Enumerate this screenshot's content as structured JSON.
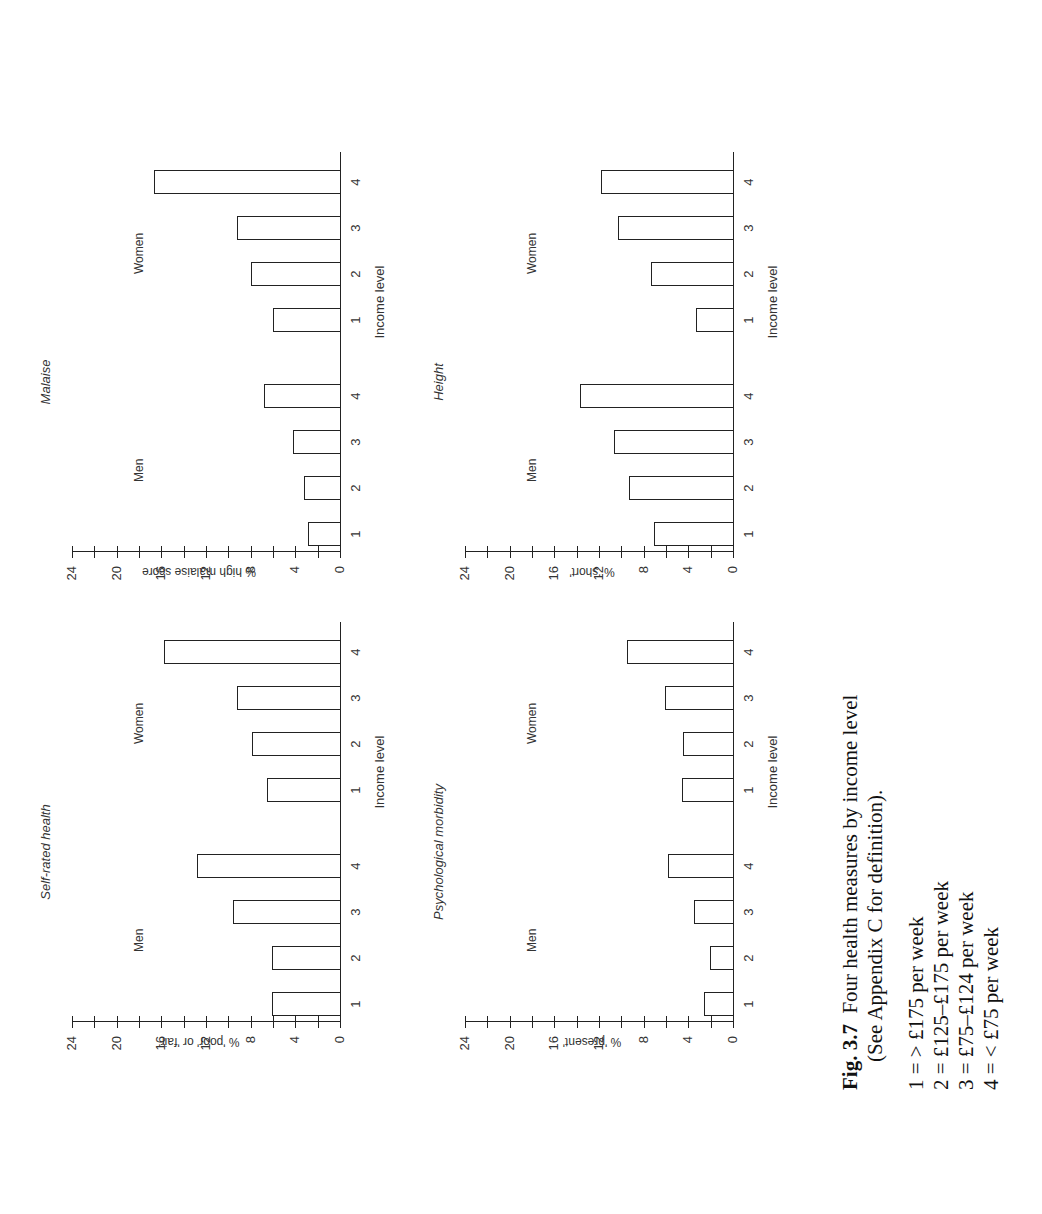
{
  "figure": {
    "label": "Fig. 3.7",
    "title": "Four health measures by income level",
    "subtitle": "(See Appendix C for definition).",
    "legend": [
      "1 = > £175 per week",
      "2 = £125–£175 per week",
      "3 = £75–£124 per week",
      "4 = < £75 per week"
    ]
  },
  "panels": {
    "self_rated": {
      "title": "Self-rated health",
      "ylabel": "% 'poor' or 'fair'",
      "xlabel": "Income level",
      "men": "Men",
      "women": "Women",
      "ticks": [
        "0",
        "4",
        "8",
        "12",
        "16",
        "20",
        "24"
      ],
      "cats": [
        "1",
        "2",
        "3",
        "4"
      ]
    },
    "malaise": {
      "title": "Malaise",
      "ylabel": "% high malaise score",
      "xlabel": "Income level",
      "men": "Men",
      "women": "Women",
      "ticks": [
        "0",
        "4",
        "8",
        "12",
        "16",
        "20",
        "24"
      ],
      "cats": [
        "1",
        "2",
        "3",
        "4"
      ]
    },
    "psych": {
      "title": "Psychological morbidity",
      "ylabel": "% 'present'",
      "xlabel": "Income level",
      "men": "Men",
      "women": "Women",
      "ticks": [
        "0",
        "4",
        "8",
        "12",
        "16",
        "20",
        "24"
      ],
      "cats": [
        "1",
        "2",
        "3",
        "4"
      ]
    },
    "height": {
      "title": "Height",
      "ylabel": "% 'short'",
      "xlabel": "Income level",
      "men": "Men",
      "women": "Women",
      "ticks": [
        "0",
        "4",
        "8",
        "12",
        "16",
        "20",
        "24"
      ],
      "cats": [
        "1",
        "2",
        "3",
        "4"
      ]
    }
  },
  "chart_data": [
    {
      "type": "bar",
      "title": "Self-rated health",
      "xlabel": "Income level",
      "ylabel": "% 'poor' or 'fair'",
      "ylim": [
        0,
        24
      ],
      "yticks": [
        0,
        4,
        8,
        12,
        16,
        20,
        24
      ],
      "categories": [
        "1",
        "2",
        "3",
        "4"
      ],
      "series": [
        {
          "name": "Men",
          "values": [
            6.1,
            6.1,
            9.6,
            12.8
          ]
        },
        {
          "name": "Women",
          "values": [
            6.5,
            7.9,
            9.2,
            15.8
          ]
        }
      ],
      "grid": false,
      "orientation": "rotated 90° counter-clockwise on page"
    },
    {
      "type": "bar",
      "title": "Malaise",
      "xlabel": "Income level",
      "ylabel": "% high malaise score",
      "ylim": [
        0,
        24
      ],
      "yticks": [
        0,
        4,
        8,
        12,
        16,
        20,
        24
      ],
      "categories": [
        "1",
        "2",
        "3",
        "4"
      ],
      "series": [
        {
          "name": "Men",
          "values": [
            2.9,
            3.2,
            4.2,
            6.8
          ]
        },
        {
          "name": "Women",
          "values": [
            6.0,
            8.0,
            9.2,
            16.7
          ]
        }
      ],
      "grid": false
    },
    {
      "type": "bar",
      "title": "Psychological morbidity",
      "xlabel": "Income level",
      "ylabel": "% 'present'",
      "ylim": [
        0,
        24
      ],
      "yticks": [
        0,
        4,
        8,
        12,
        16,
        20,
        24
      ],
      "categories": [
        "1",
        "2",
        "3",
        "4"
      ],
      "series": [
        {
          "name": "Men",
          "values": [
            2.6,
            2.1,
            3.5,
            5.8
          ]
        },
        {
          "name": "Women",
          "values": [
            4.6,
            4.5,
            6.1,
            9.5
          ]
        }
      ],
      "grid": false
    },
    {
      "type": "bar",
      "title": "Height",
      "xlabel": "Income level",
      "ylabel": "% 'short'",
      "ylim": [
        0,
        24
      ],
      "yticks": [
        0,
        4,
        8,
        12,
        16,
        20,
        24
      ],
      "categories": [
        "1",
        "2",
        "3",
        "4"
      ],
      "series": [
        {
          "name": "Men",
          "values": [
            7.1,
            9.3,
            10.7,
            13.7
          ]
        },
        {
          "name": "Women",
          "values": [
            3.3,
            7.3,
            10.3,
            11.8
          ]
        }
      ],
      "grid": false
    }
  ]
}
